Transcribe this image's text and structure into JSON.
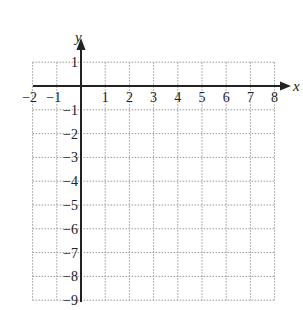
{
  "graph": {
    "x_axis_label": "x",
    "y_axis_label": "y",
    "x_min": -2,
    "x_max": 8,
    "y_min": -9,
    "y_max": 1,
    "x_tick_labels": [
      "−2",
      "−1",
      "1",
      "2",
      "3",
      "4",
      "5",
      "6",
      "7",
      "8"
    ],
    "x_tick_values": [
      -2,
      -1,
      1,
      2,
      3,
      4,
      5,
      6,
      7,
      8
    ],
    "y_tick_labels": [
      "1",
      "−1",
      "−2",
      "−3",
      "−4",
      "−5",
      "−6",
      "−7",
      "−8",
      "−9"
    ],
    "y_tick_values": [
      1,
      -1,
      -2,
      -3,
      -4,
      -5,
      -6,
      -7,
      -8,
      -9
    ],
    "grid": "dotted",
    "colors": {
      "axis": "#222222",
      "grid": "#9a9a9a",
      "text": "#222222",
      "background": "#ffffff"
    }
  }
}
